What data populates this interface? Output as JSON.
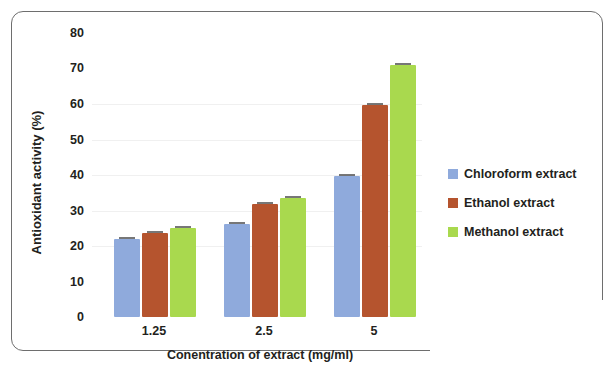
{
  "chart_data": {
    "type": "bar",
    "title": "",
    "xlabel": "Conentration of extract (mg/ml)",
    "ylabel": "Antioxidant activity (%)",
    "categories": [
      "1.25",
      "2.5",
      "5"
    ],
    "series": [
      {
        "name": "Chloroform extract",
        "color": "#8FAADC",
        "values": [
          22.0,
          26.2,
          39.8
        ]
      },
      {
        "name": "Ethanol extract",
        "color": "#B5542E",
        "values": [
          23.6,
          31.8,
          59.8
        ]
      },
      {
        "name": "Methanol extract",
        "color": "#A9D94E",
        "values": [
          25.2,
          33.6,
          71.0
        ]
      }
    ],
    "ylim": [
      0,
      80
    ],
    "yticks": [
      "0",
      "10",
      "20",
      "30",
      "40",
      "50",
      "60",
      "70",
      "80"
    ],
    "grid": false,
    "legend_position": "right",
    "error_bars": true
  },
  "axes": {
    "y_title": "Antioxidant activity (%)",
    "x_title": "Conentration of extract (mg/ml)",
    "y_ticks": [
      {
        "label": "80",
        "value": 80
      },
      {
        "label": "70",
        "value": 70
      },
      {
        "label": "60",
        "value": 60
      },
      {
        "label": "50",
        "value": 50
      },
      {
        "label": "40",
        "value": 40
      },
      {
        "label": "30",
        "value": 30
      },
      {
        "label": "20",
        "value": 20
      },
      {
        "label": "10",
        "value": 10
      },
      {
        "label": "0",
        "value": 0
      }
    ],
    "x_ticks": [
      "1.25",
      "2.5",
      "5"
    ]
  },
  "legend": {
    "items": [
      {
        "label": "Chloroform extract",
        "color": "#8FAADC"
      },
      {
        "label": "Ethanol extract",
        "color": "#B5542E"
      },
      {
        "label": "Methanol extract",
        "color": "#A9D94E"
      }
    ]
  },
  "colors": {
    "chloroform": "#8FAADC",
    "ethanol": "#B5542E",
    "methanol": "#A9D94E",
    "text": "#231f20",
    "frame": "#6e6e6e"
  }
}
